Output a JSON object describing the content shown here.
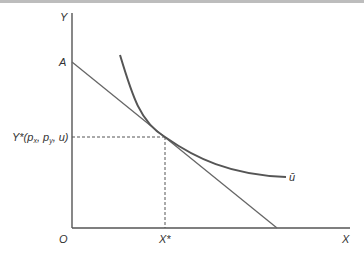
{
  "diagram": {
    "type": "consumer-optimum",
    "labels": {
      "y_axis": "Y",
      "x_axis": "X",
      "origin": "O",
      "y_intercept": "A",
      "y_star": "Y*(p",
      "y_star_sub_x": "x",
      "y_star_mid": ", p",
      "y_star_sub_y": "y",
      "y_star_end": ", u)",
      "x_star": "X*",
      "indifference_curve": "ū"
    },
    "colors": {
      "axis": "#555555",
      "budget_line": "#666666",
      "indifference_curve": "#555555",
      "dashed": "#555555",
      "text": "#333333"
    }
  }
}
